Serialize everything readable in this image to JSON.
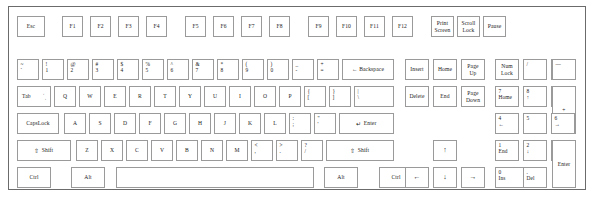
{
  "diagram": {
    "case_color": "#6b6b6b",
    "key_border_color": "#9a9a9a",
    "key_face_color": "#ffffff"
  },
  "function_row": {
    "escape": "Esc",
    "f_keys": [
      "F1",
      "F2",
      "F3",
      "F4",
      "F5",
      "F6",
      "F7",
      "F8",
      "F9",
      "F10",
      "F11",
      "F12"
    ],
    "print_screen": "Print\nScreen",
    "scroll_lock": "Scroll\nLock",
    "pause": "Pause"
  },
  "number_row": {
    "keys": [
      {
        "top": "~",
        "bottom": "`"
      },
      {
        "top": "!",
        "bottom": "1"
      },
      {
        "top": "@",
        "bottom": "2"
      },
      {
        "top": "#",
        "bottom": "3"
      },
      {
        "top": "$",
        "bottom": "4"
      },
      {
        "top": "%",
        "bottom": "5"
      },
      {
        "top": "^",
        "bottom": "6"
      },
      {
        "top": "&",
        "bottom": "7"
      },
      {
        "top": "*",
        "bottom": "8"
      },
      {
        "top": "(",
        "bottom": "9"
      },
      {
        "top": ")",
        "bottom": "0"
      },
      {
        "top": "_",
        "bottom": "-"
      },
      {
        "top": "+",
        "bottom": "="
      }
    ],
    "backspace": "← Backspace"
  },
  "tab_row": {
    "tab": "Tab",
    "tab_arrow_top": "←",
    "tab_arrow_bottom": "→",
    "letters": [
      "Q",
      "W",
      "E",
      "R",
      "T",
      "Y",
      "U",
      "I",
      "O",
      "P"
    ],
    "bracket_left": {
      "top": "{",
      "bottom": "["
    },
    "bracket_right": {
      "top": "}",
      "bottom": "]"
    },
    "backslash": {
      "top": "|",
      "bottom": "\\"
    }
  },
  "home_row": {
    "caps_lock": "CapsLock",
    "letters": [
      "A",
      "S",
      "D",
      "F",
      "G",
      "H",
      "J",
      "K",
      "L"
    ],
    "semicolon": {
      "top": ":",
      "bottom": ";"
    },
    "quote": {
      "top": "\"",
      "bottom": "'"
    },
    "enter": "Enter",
    "enter_glyph": "↵"
  },
  "shift_row": {
    "shift_left": "Shift",
    "shift_right": "Shift",
    "shift_glyph": "⇧",
    "letters": [
      "Z",
      "X",
      "C",
      "V",
      "B",
      "N",
      "M"
    ],
    "comma": {
      "top": "<",
      "bottom": ","
    },
    "period": {
      "top": ">",
      "bottom": "."
    },
    "slash": {
      "top": "?",
      "bottom": "/"
    }
  },
  "bottom_row": {
    "ctrl_left": "Ctrl",
    "alt_left": "Alt",
    "space": "",
    "alt_right": "Alt",
    "ctrl_right": "Ctrl"
  },
  "navigation_cluster": {
    "insert": "Insert",
    "home": "Home",
    "page_up": "Page\nUp",
    "delete": "Delete",
    "end": "End",
    "page_down": "Page\nDown",
    "arrow_up": "↑",
    "arrow_left": "←",
    "arrow_down": "↓",
    "arrow_right": "→"
  },
  "numeric_keypad": {
    "num_lock": "Num\nLock",
    "divide": "/",
    "multiply": "*",
    "subtract": "—",
    "add": "+",
    "enter": "Enter",
    "keys": [
      {
        "top": "7",
        "bottom": "Home"
      },
      {
        "top": "8",
        "bottom": "↑"
      },
      {
        "top": "9",
        "bottom": "Pg Up"
      },
      {
        "top": "4",
        "bottom": "←"
      },
      {
        "top": "5",
        "bottom": ""
      },
      {
        "top": "6",
        "bottom": "→"
      },
      {
        "top": "1",
        "bottom": "End"
      },
      {
        "top": "2",
        "bottom": "↓"
      },
      {
        "top": "3",
        "bottom": "Pg Dn"
      },
      {
        "top": "0",
        "bottom": "Ins"
      },
      {
        "top": ".",
        "bottom": "Del"
      }
    ]
  }
}
